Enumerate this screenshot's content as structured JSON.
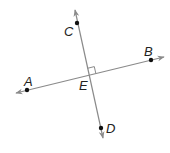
{
  "diagram": {
    "type": "perpendicular-lines",
    "colors": {
      "line": "#8a8a8a",
      "point": "#111111",
      "label": "#222222"
    },
    "lines": [
      {
        "name": "line-CD",
        "x1": 75,
        "y1": 10,
        "x2": 103,
        "y2": 138
      },
      {
        "name": "line-AB",
        "x1": 16,
        "y1": 93,
        "x2": 164,
        "y2": 57
      }
    ],
    "points": [
      {
        "id": "C",
        "x": 77,
        "y": 23
      },
      {
        "id": "D",
        "x": 101,
        "y": 128
      },
      {
        "id": "A",
        "x": 27,
        "y": 90
      },
      {
        "id": "B",
        "x": 151,
        "y": 60
      }
    ],
    "labels": {
      "C": "C",
      "D": "D",
      "A": "A",
      "B": "B",
      "E": "E"
    },
    "right_angle_at": "E"
  }
}
